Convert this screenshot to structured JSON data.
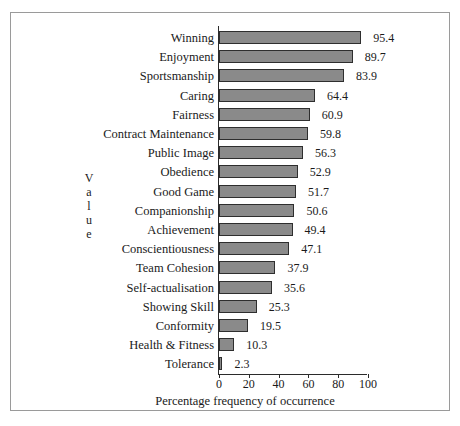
{
  "figure": {
    "background": "#ffffff",
    "frame_color": "#9a9a9a",
    "bar_fill": "#8a8a8a",
    "bar_stroke": "#2e2e2e",
    "axis_color": "#2b2b2b",
    "category_axis_title_letters": [
      "V",
      "a",
      "l",
      "u",
      "e"
    ]
  },
  "chart_data": {
    "type": "bar",
    "orientation": "horizontal",
    "title": "",
    "xlabel": "Percentage frequency of occurrence",
    "ylabel": "Value",
    "xlim": [
      0,
      100
    ],
    "xticks": [
      0,
      20,
      40,
      60,
      80,
      100
    ],
    "xtick_labels": [
      "0",
      "20",
      "40",
      "60",
      "80",
      "100"
    ],
    "grid": false,
    "legend": false,
    "data_labels": true,
    "categories": [
      "Winning",
      "Enjoyment",
      "Sportsmanship",
      "Caring",
      "Fairness",
      "Contract Maintenance",
      "Public Image",
      "Obedience",
      "Good Game",
      "Companionship",
      "Achievement",
      "Conscientiousness",
      "Team Cohesion",
      "Self-actualisation",
      "Showing  Skill",
      "Conformity",
      "Health & Fitness",
      "Tolerance"
    ],
    "values": [
      95.4,
      89.7,
      83.9,
      64.4,
      60.9,
      59.8,
      56.3,
      52.9,
      51.7,
      50.6,
      49.4,
      47.1,
      37.9,
      35.6,
      25.3,
      19.5,
      10.3,
      2.3
    ],
    "value_labels": [
      "95.4",
      "89.7",
      "83.9",
      "64.4",
      "60.9",
      "59.8",
      "56.3",
      "52.9",
      "51.7",
      "50.6",
      "49.4",
      "47.1",
      "37.9",
      "35.6",
      "25.3",
      "19.5",
      "10.3",
      "2.3"
    ]
  }
}
